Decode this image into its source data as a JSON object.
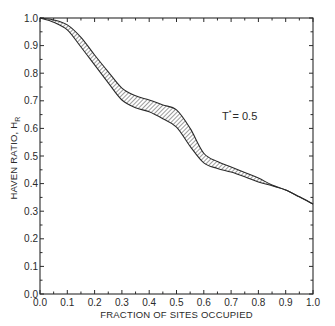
{
  "chart_data": {
    "type": "area",
    "title": "",
    "xlabel": "FRACTION OF SITES OCCUPIED",
    "ylabel": "HAVEN RATIO, H",
    "ylabel_subscript": "R",
    "xlim": [
      0.0,
      1.0
    ],
    "ylim": [
      0.0,
      1.0
    ],
    "x_ticks": [
      "0.0",
      "0.1",
      "0.2",
      "0.3",
      "0.4",
      "0.5",
      "0.6",
      "0.7",
      "0.8",
      "0.9",
      "1.0"
    ],
    "y_ticks": [
      "0.0",
      "0.1",
      "0.2",
      "0.3",
      "0.4",
      "0.5",
      "0.6",
      "0.7",
      "0.8",
      "0.9",
      "1.0"
    ],
    "minor_tick_step": 0.05,
    "grid": false,
    "legend": null,
    "annotations": [
      {
        "text": "T",
        "superscript": "*",
        "suffix": "= 0.5",
        "x": 0.74,
        "y": 0.63
      }
    ],
    "series": [
      {
        "name": "upper bound",
        "x": [
          0.0,
          0.05,
          0.1,
          0.15,
          0.2,
          0.25,
          0.3,
          0.35,
          0.4,
          0.45,
          0.5,
          0.55,
          0.6,
          0.65,
          0.7,
          0.75,
          0.8,
          0.85,
          0.9,
          0.95,
          1.0
        ],
        "values": [
          1.0,
          0.993,
          0.975,
          0.93,
          0.866,
          0.805,
          0.746,
          0.718,
          0.703,
          0.685,
          0.667,
          0.6,
          0.51,
          0.48,
          0.46,
          0.44,
          0.42,
          0.395,
          0.377,
          0.352,
          0.326
        ]
      },
      {
        "name": "lower bound",
        "x": [
          0.0,
          0.05,
          0.1,
          0.15,
          0.2,
          0.25,
          0.3,
          0.35,
          0.4,
          0.45,
          0.5,
          0.55,
          0.6,
          0.65,
          0.7,
          0.75,
          0.8,
          0.85,
          0.9,
          0.95,
          1.0
        ],
        "values": [
          1.0,
          0.985,
          0.957,
          0.895,
          0.83,
          0.765,
          0.703,
          0.675,
          0.66,
          0.635,
          0.605,
          0.535,
          0.475,
          0.455,
          0.442,
          0.425,
          0.406,
          0.392,
          0.377,
          0.352,
          0.326
        ]
      }
    ],
    "fill_between": {
      "upper": "upper bound",
      "lower": "lower bound",
      "pattern": "diagonal-hatch"
    }
  },
  "colors": {
    "ink": "#2a2a2a",
    "background": "#ffffff"
  }
}
